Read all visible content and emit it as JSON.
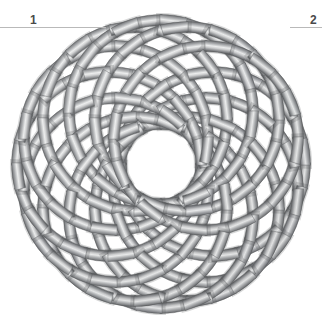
{
  "figure": {
    "kind": "rosette-knot-diagram",
    "background_color": "#ffffff",
    "canvas": {
      "width": 322,
      "height": 315
    }
  },
  "annotations": [
    {
      "id": "label-1",
      "text": "1",
      "rule": {
        "x": 0,
        "y": 27,
        "width": 106
      },
      "label_x": 30,
      "label_y": 14,
      "color": "#4a4a4a",
      "rule_color": "#b9b9b9"
    },
    {
      "id": "label-2",
      "text": "2",
      "rule": {
        "x": 290,
        "y": 27,
        "width": 32
      },
      "label_x": 310,
      "label_y": 14,
      "color": "#4a4a4a",
      "rule_color": "#b9b9b9"
    }
  ],
  "knot": {
    "name": "interlaced-rosette",
    "center_x": 161,
    "center_y": 164,
    "ring_count": 12,
    "ring_radius": 92,
    "offset_radius": 52,
    "band_width": 11,
    "start_angle_deg": 0,
    "band_colors": {
      "edge_dark": "#6f7173",
      "mid_light": "#e7e8e9",
      "body_gray": "#9a9c9e",
      "outline": "#5e6062",
      "shadow": "#7d7f81"
    }
  }
}
